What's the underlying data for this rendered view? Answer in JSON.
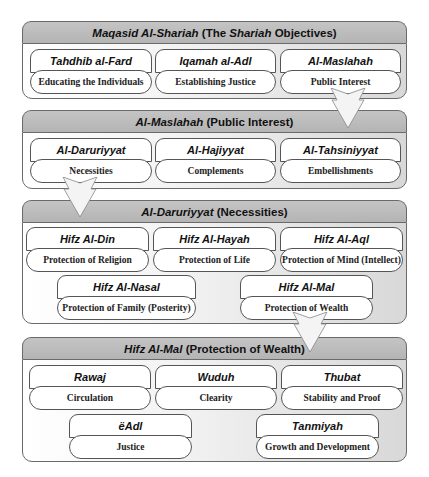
{
  "sections": [
    {
      "header_italic": "Maqasid Al-Shariah",
      "header_rest_1": " (The ",
      "header_italic_2": "Shariah",
      "header_rest_2": " Objectives)",
      "cards": [
        {
          "title": "Tahdhib al-Fard",
          "subtitle": "Educating the Individuals"
        },
        {
          "title": "Iqamah al-Adl",
          "subtitle": "Establishing Justice"
        },
        {
          "title": "Al-Maslahah",
          "subtitle": "Public Interest"
        }
      ]
    },
    {
      "header_italic": "Al-Maslahah",
      "header_rest": " (Public Interest)",
      "cards": [
        {
          "title": "Al-Daruriyyat",
          "subtitle": "Necessities"
        },
        {
          "title": "Al-Hajiyyat",
          "subtitle": "Complements"
        },
        {
          "title": "Al-Tahsiniyyat",
          "subtitle": "Embellishments"
        }
      ]
    },
    {
      "header_italic": "Al-Daruriyyat",
      "header_rest": " (Necessities)",
      "cards": [
        {
          "title": "Hifz Al-Din",
          "subtitle": "Protection of Religion"
        },
        {
          "title": "Hifz Al-Hayah",
          "subtitle": "Protection of Life"
        },
        {
          "title": "Hifz Al-Aql",
          "subtitle": "Protection of Mind (Intellect)"
        },
        {
          "title": "Hifz Al-Nasal",
          "subtitle": "Protection of Family (Posterity)"
        },
        {
          "title": "Hifz Al-Mal",
          "subtitle": "Protection of Wealth"
        }
      ]
    },
    {
      "header_italic": "Hifz Al-Mal",
      "header_rest": " (Protection of Wealth)",
      "cards": [
        {
          "title": "Rawaj",
          "subtitle": "Circulation"
        },
        {
          "title": "Wuduh",
          "subtitle": "Clearity"
        },
        {
          "title": "Thubat",
          "subtitle": "Stability and Proof"
        },
        {
          "title": "ëAdl",
          "subtitle": "Justice"
        },
        {
          "title": "Tanmiyah",
          "subtitle": "Growth and Development"
        }
      ]
    }
  ],
  "colors": {
    "header_fill": "#bcbcbc",
    "border": "#6a6a6a",
    "card_fill": "#ffffff",
    "arrow_fill": "#f4f4f4"
  }
}
